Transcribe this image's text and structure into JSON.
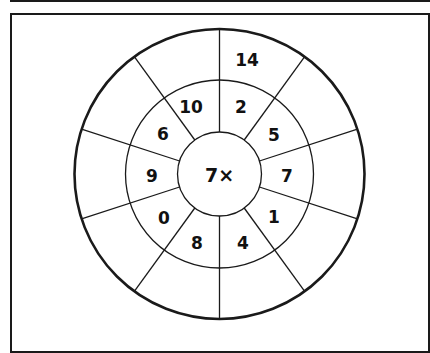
{
  "worksheet": {
    "center_label": "7×",
    "multiplier": 7,
    "operator": "×",
    "inner_ring_numbers": [
      {
        "position": "top-left",
        "value": "10"
      },
      {
        "position": "top-right",
        "value": "2"
      },
      {
        "position": "upper-right",
        "value": "5"
      },
      {
        "position": "right",
        "value": "7"
      },
      {
        "position": "lower-right",
        "value": "1"
      },
      {
        "position": "bottom-right",
        "value": "4"
      },
      {
        "position": "bottom-left",
        "value": "8"
      },
      {
        "position": "lower-left",
        "value": "0"
      },
      {
        "position": "left",
        "value": "9"
      },
      {
        "position": "upper-left",
        "value": "6"
      }
    ],
    "outer_ring_answers": [
      {
        "position": "top-right",
        "value": "14"
      },
      {
        "position": "top-left",
        "value": ""
      },
      {
        "position": "upper-right",
        "value": ""
      },
      {
        "position": "right",
        "value": ""
      },
      {
        "position": "lower-right",
        "value": ""
      },
      {
        "position": "bottom-right",
        "value": ""
      },
      {
        "position": "bottom-left",
        "value": ""
      },
      {
        "position": "lower-left",
        "value": ""
      },
      {
        "position": "left",
        "value": ""
      },
      {
        "position": "upper-left",
        "value": ""
      }
    ],
    "segments": 10,
    "stroke_color": "#1a1a1a",
    "background_color": "#ffffff"
  }
}
